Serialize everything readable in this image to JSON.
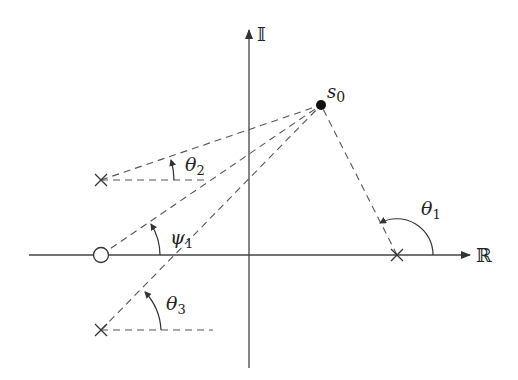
{
  "diagram": {
    "title": "",
    "colors": {
      "ink": "#3a3a3a",
      "dashed": "#555555",
      "point": "#111111",
      "background": "#ffffff"
    },
    "axes": {
      "real_label": "ℝ",
      "imag_label": "𝕀"
    },
    "point": {
      "label_main": "s",
      "label_sub": "0"
    },
    "poles": [
      {
        "id": "pole-real-axis",
        "marker": "×"
      },
      {
        "id": "pole-upper-left",
        "marker": "×"
      },
      {
        "id": "pole-lower-left",
        "marker": "×"
      }
    ],
    "zeros": [
      {
        "id": "zero-real-axis",
        "marker": "○"
      }
    ],
    "angles": [
      {
        "id": "theta1",
        "main": "θ",
        "sub": "1"
      },
      {
        "id": "theta2",
        "main": "θ",
        "sub": "2"
      },
      {
        "id": "theta3",
        "main": "θ",
        "sub": "3"
      },
      {
        "id": "psi1",
        "main": "ψ",
        "sub": "1"
      }
    ]
  }
}
